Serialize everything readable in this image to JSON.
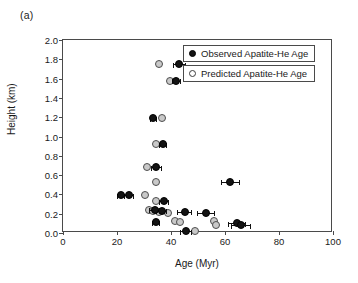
{
  "panel": {
    "label": "(a)"
  },
  "legend": {
    "entries": [
      {
        "key": "observed",
        "label": "Observed Apatite-He Age",
        "marker": "filled-circle",
        "color": "#131313"
      },
      {
        "key": "predicted",
        "label": "Predicted Apatite-He Age",
        "marker": "open-circle",
        "color": "#c9c9c9"
      }
    ]
  },
  "chart_data": {
    "type": "scatter",
    "title": "",
    "xlabel": "Age (Myr)",
    "ylabel": "Height (km)",
    "xlim": [
      0,
      100
    ],
    "ylim": [
      0.0,
      2.0
    ],
    "xticks": [
      0,
      20,
      40,
      60,
      80,
      100
    ],
    "yticks": [
      "0.0",
      "0.2",
      "0.4",
      "0.6",
      "0.8",
      "1.0",
      "1.2",
      "1.4",
      "1.6",
      "1.8",
      "2.0"
    ],
    "grid": false,
    "legend_position": "top-right-inside",
    "series": [
      {
        "name": "Observed Apatite-He Age",
        "marker": "filled-circle",
        "color": "#131313",
        "points": [
          {
            "x": 43.0,
            "y": 1.75,
            "xerr": 2.4
          },
          {
            "x": 42.0,
            "y": 1.58,
            "xerr": 1.6
          },
          {
            "x": 33.5,
            "y": 1.19,
            "xerr": 1.4
          },
          {
            "x": 37.0,
            "y": 0.92,
            "xerr": 1.6
          },
          {
            "x": 34.5,
            "y": 0.68,
            "xerr": 2.0
          },
          {
            "x": 62.0,
            "y": 0.53,
            "xerr": 3.6
          },
          {
            "x": 21.5,
            "y": 0.39,
            "xerr": 1.6
          },
          {
            "x": 24.5,
            "y": 0.39,
            "xerr": 1.8
          },
          {
            "x": 37.5,
            "y": 0.33,
            "xerr": 1.8
          },
          {
            "x": 34.0,
            "y": 0.24,
            "xerr": 2.0
          },
          {
            "x": 36.5,
            "y": 0.23,
            "xerr": 2.0
          },
          {
            "x": 45.0,
            "y": 0.22,
            "xerr": 2.8
          },
          {
            "x": 53.0,
            "y": 0.21,
            "xerr": 3.2
          },
          {
            "x": 34.5,
            "y": 0.11,
            "xerr": 1.6
          },
          {
            "x": 64.5,
            "y": 0.1,
            "xerr": 3.4
          },
          {
            "x": 66.0,
            "y": 0.08,
            "xerr": 3.6
          },
          {
            "x": 45.5,
            "y": 0.02,
            "xerr": 2.2
          }
        ]
      },
      {
        "name": "Predicted Apatite-He Age",
        "marker": "open-circle",
        "color": "#c9c9c9",
        "points": [
          {
            "x": 35.5,
            "y": 1.75
          },
          {
            "x": 39.5,
            "y": 1.58
          },
          {
            "x": 36.5,
            "y": 1.19
          },
          {
            "x": 34.5,
            "y": 0.92
          },
          {
            "x": 31.0,
            "y": 0.68
          },
          {
            "x": 34.5,
            "y": 0.53
          },
          {
            "x": 30.5,
            "y": 0.39
          },
          {
            "x": 34.5,
            "y": 0.33
          },
          {
            "x": 32.0,
            "y": 0.24
          },
          {
            "x": 33.5,
            "y": 0.23
          },
          {
            "x": 35.5,
            "y": 0.22
          },
          {
            "x": 39.0,
            "y": 0.21
          },
          {
            "x": 41.5,
            "y": 0.12
          },
          {
            "x": 43.5,
            "y": 0.11
          },
          {
            "x": 56.0,
            "y": 0.12
          },
          {
            "x": 56.5,
            "y": 0.08
          },
          {
            "x": 49.0,
            "y": 0.02
          }
        ]
      }
    ]
  }
}
